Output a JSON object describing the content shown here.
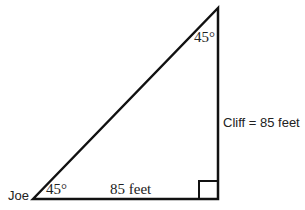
{
  "diagram": {
    "type": "right-triangle",
    "labels": {
      "vertex_left": "Joe",
      "angle_bottom": "45°",
      "angle_top": "45°",
      "base": "85 feet",
      "vertical_side": "Cliff = 85 feet"
    },
    "stroke_color": "#111111"
  }
}
